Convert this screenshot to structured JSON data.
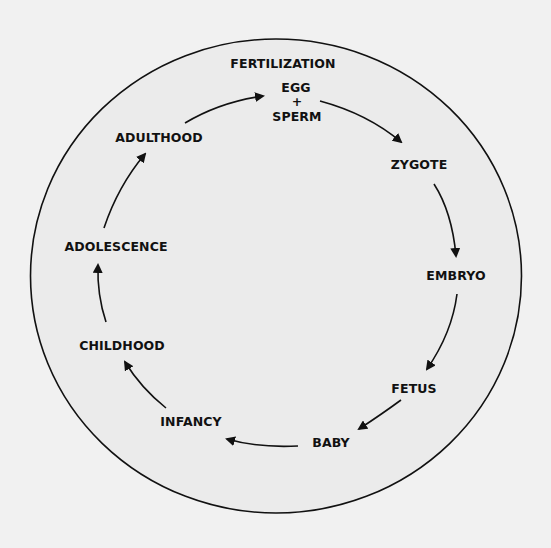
{
  "diagram": {
    "colors": {
      "background": "#f1f1f1",
      "circle_fill": "#ebebeb",
      "stroke": "#111111",
      "text": "#111111"
    },
    "header_label": "FERTILIZATION",
    "fertilization": {
      "egg": "EGG",
      "plus": "+",
      "sperm": "SPERM"
    },
    "stages": [
      {
        "id": "zygote",
        "label": "ZYGOTE"
      },
      {
        "id": "embryo",
        "label": "EMBRYO"
      },
      {
        "id": "fetus",
        "label": "FETUS"
      },
      {
        "id": "baby",
        "label": "BABY"
      },
      {
        "id": "infancy",
        "label": "INFANCY"
      },
      {
        "id": "childhood",
        "label": "CHILDHOOD"
      },
      {
        "id": "adolescence",
        "label": "ADOLESCENCE"
      },
      {
        "id": "adulthood",
        "label": "ADULTHOOD"
      }
    ],
    "sequence": [
      "EGG + SPERM",
      "ZYGOTE",
      "EMBRYO",
      "FETUS",
      "BABY",
      "INFANCY",
      "CHILDHOOD",
      "ADOLESCENCE",
      "ADULTHOOD",
      "EGG + SPERM"
    ],
    "direction": "clockwise"
  }
}
